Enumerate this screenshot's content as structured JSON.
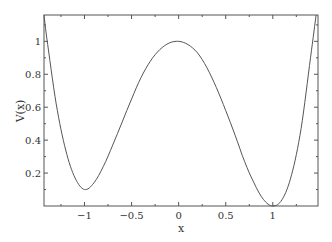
{
  "chart_data": {
    "type": "line",
    "title": "",
    "xlabel": "x",
    "ylabel": "V(x)",
    "xlim": [
      -1.43,
      1.48
    ],
    "ylim": [
      0.0,
      1.16
    ],
    "grid": false,
    "legend": null,
    "x_ticks": [
      -1,
      -0.5,
      0,
      0.5,
      1
    ],
    "x_tick_labels": [
      "−1",
      "−0.5",
      "0",
      "0.5",
      "1"
    ],
    "y_ticks": [
      0.2,
      0.4,
      0.6,
      0.8,
      1
    ],
    "y_tick_labels": [
      "0.2",
      "0.4",
      "0.6",
      "0.8",
      "1"
    ],
    "series": [
      {
        "name": "V(x)",
        "color": "#555555",
        "x": [
          -1.43,
          -1.4,
          -1.3,
          -1.2,
          -1.1,
          -1.0,
          -0.9,
          -0.8,
          -0.7,
          -0.6,
          -0.5,
          -0.4,
          -0.3,
          -0.2,
          -0.1,
          0.0,
          0.1,
          0.2,
          0.3,
          0.4,
          0.5,
          0.6,
          0.7,
          0.8,
          0.9,
          1.0,
          1.1,
          1.2,
          1.3,
          1.4,
          1.46
        ],
        "values": [
          1.16,
          1.02,
          0.62,
          0.34,
          0.17,
          0.1,
          0.14,
          0.24,
          0.37,
          0.51,
          0.65,
          0.78,
          0.88,
          0.95,
          0.99,
          1.0,
          0.98,
          0.93,
          0.84,
          0.72,
          0.58,
          0.43,
          0.27,
          0.14,
          0.04,
          0.0,
          0.04,
          0.19,
          0.47,
          0.9,
          1.16
        ]
      }
    ]
  }
}
